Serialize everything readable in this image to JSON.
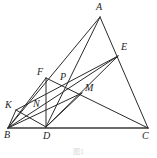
{
  "figure": {
    "caption": "图1",
    "caption_top": 146,
    "width": 157,
    "height": 158,
    "stroke_color": "#2b2b2b",
    "base_stroke_color": "#3a3a3a",
    "background_color": "#ffffff",
    "label_color": "#1d1d1d",
    "points": [
      {
        "id": "A",
        "label": "A",
        "x": 100,
        "y": 17,
        "label_x": 96,
        "label_y": 2
      },
      {
        "id": "B",
        "label": "B",
        "x": 8,
        "y": 128,
        "label_x": 4,
        "label_y": 130
      },
      {
        "id": "C",
        "label": "C",
        "x": 148,
        "y": 128,
        "label_x": 142,
        "label_y": 131
      },
      {
        "id": "D",
        "label": "D",
        "x": 46,
        "y": 127,
        "label_x": 43,
        "label_y": 131
      },
      {
        "id": "E",
        "label": "E",
        "x": 118,
        "y": 56,
        "label_x": 121,
        "label_y": 42
      },
      {
        "id": "F",
        "label": "F",
        "x": 46,
        "y": 78,
        "label_x": 37,
        "label_y": 67
      },
      {
        "id": "K",
        "label": "K",
        "x": 16,
        "y": 110,
        "label_x": 5,
        "label_y": 100
      },
      {
        "id": "M",
        "label": "M",
        "x": 82,
        "y": 93,
        "label_x": 85,
        "label_y": 83
      },
      {
        "id": "N",
        "label": "N",
        "x": 38,
        "y": 107,
        "label_x": 33,
        "label_y": 99
      },
      {
        "id": "P",
        "label": "P",
        "x": 64,
        "y": 82,
        "label_x": 60,
        "label_y": 72
      }
    ],
    "segments": [
      {
        "id": "BC",
        "from": "B",
        "to": "C",
        "kind": "base",
        "name": "segment-bc-base"
      },
      {
        "id": "AB",
        "from": "A",
        "to": "B",
        "kind": "normal",
        "name": "segment-ab"
      },
      {
        "id": "AC",
        "from": "A",
        "to": "C",
        "kind": "normal",
        "name": "segment-ac"
      },
      {
        "id": "AD",
        "from": "A",
        "to": "D",
        "kind": "normal",
        "name": "segment-ad"
      },
      {
        "id": "EB",
        "from": "E",
        "to": "B",
        "kind": "normal",
        "name": "segment-eb"
      },
      {
        "id": "ED",
        "from": "E",
        "to": "D",
        "kind": "normal",
        "name": "segment-ed"
      },
      {
        "id": "EK",
        "from": "E",
        "to": "K",
        "kind": "normal",
        "name": "segment-ek"
      },
      {
        "id": "FD",
        "from": "F",
        "to": "D",
        "kind": "normal",
        "name": "segment-fd"
      },
      {
        "id": "FB",
        "from": "F",
        "to": "B",
        "kind": "normal",
        "name": "segment-fb"
      },
      {
        "id": "FC",
        "from": "F",
        "to": "C",
        "kind": "normal",
        "name": "segment-fc"
      },
      {
        "id": "KD",
        "from": "K",
        "to": "D",
        "kind": "normal",
        "name": "segment-kd"
      },
      {
        "id": "KB",
        "from": "K",
        "to": "B",
        "kind": "normal",
        "name": "segment-kb"
      },
      {
        "id": "BM",
        "from": "B",
        "to": "M",
        "kind": "normal",
        "name": "segment-bm"
      },
      {
        "id": "DM",
        "from": "D",
        "to": "M",
        "kind": "normal",
        "name": "segment-dm"
      }
    ]
  }
}
